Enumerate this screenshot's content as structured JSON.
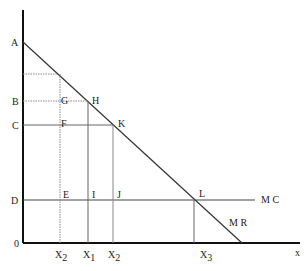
{
  "diagram": {
    "type": "economics-monopoly-price-discrimination",
    "axes": {
      "origin_label": "0",
      "x_label": "x"
    },
    "price_labels": {
      "A": "A",
      "B": "B",
      "C": "C",
      "D": "D"
    },
    "point_labels": {
      "G": "G",
      "H": "H",
      "F": "F",
      "K": "K",
      "E": "E",
      "I": "I",
      "J": "J",
      "L": "L"
    },
    "curve_labels": {
      "mc": "M C",
      "mr": "M R"
    },
    "quantity_labels": {
      "x2_left": {
        "base": "X",
        "sub": "2"
      },
      "x1": {
        "base": "X",
        "sub": "1"
      },
      "x2_right": {
        "base": "X",
        "sub": "2"
      },
      "x3": {
        "base": "X",
        "sub": "3"
      }
    },
    "colors": {
      "axis": "#111111",
      "line": "#444444",
      "guide": "#777777"
    }
  }
}
